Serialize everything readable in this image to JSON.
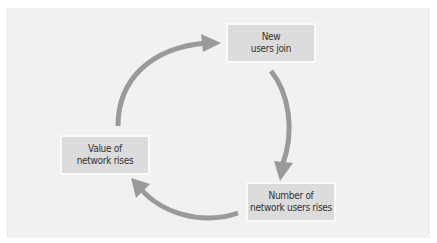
{
  "header": {
    "cutoff_text": "Figure: Network effects cycle"
  },
  "diagram": {
    "type": "cycle",
    "nodes": [
      {
        "id": "new-users",
        "line1": "New",
        "line2": "users join"
      },
      {
        "id": "number-users",
        "line1": "Number of",
        "line2": "network users rises"
      },
      {
        "id": "value-network",
        "line1": "Value of",
        "line2": "network rises"
      }
    ],
    "edges": [
      {
        "from": "new-users",
        "to": "number-users"
      },
      {
        "from": "number-users",
        "to": "value-network"
      },
      {
        "from": "value-network",
        "to": "new-users"
      }
    ],
    "colors": {
      "panel": "#f1f1f0",
      "node_fill": "#dcdcdc",
      "arrow": "#9a9a9a",
      "text": "#333333"
    }
  }
}
